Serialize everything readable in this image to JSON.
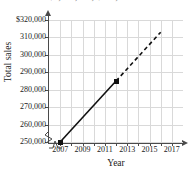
{
  "figure": {
    "cropped_caption": "rate of $1,000,000; $500,000"
  },
  "chart_data": {
    "type": "line",
    "title": "",
    "xlabel": "Year",
    "ylabel": "Total sales",
    "grid": true,
    "legend": "none",
    "xlim": [
      2006,
      2018
    ],
    "ylim": [
      250000,
      320000
    ],
    "y_axis_break": true,
    "x_axis_break": true,
    "x_tick_values": [
      2007,
      2008,
      2009,
      2010,
      2011,
      2012,
      2013,
      2014,
      2015,
      2016,
      2017
    ],
    "x_tick_labels": [
      "2007",
      "",
      "2009",
      "",
      "2011",
      "",
      "2013",
      "",
      "2015",
      "",
      "2017"
    ],
    "x_labeled_ticks": [
      "2007",
      "2009",
      "2011",
      "2013",
      "2015",
      "2017"
    ],
    "y_tick_values": [
      250000,
      260000,
      270000,
      280000,
      290000,
      300000,
      310000,
      320000
    ],
    "y_tick_labels": [
      "250,000",
      "260,000",
      "270,000",
      "280,000",
      "290,000",
      "300,000",
      "310,000",
      "$320,000"
    ],
    "series": [
      {
        "name": "actual-sales",
        "style": "solid",
        "color": "#111111",
        "marker": "square",
        "x": [
          2007,
          2012
        ],
        "values": [
          250000,
          285000
        ]
      },
      {
        "name": "projected-sales",
        "style": "dashed",
        "color": "#111111",
        "marker": "none",
        "x": [
          2012,
          2016
        ],
        "values": [
          285000,
          313000
        ]
      }
    ]
  }
}
